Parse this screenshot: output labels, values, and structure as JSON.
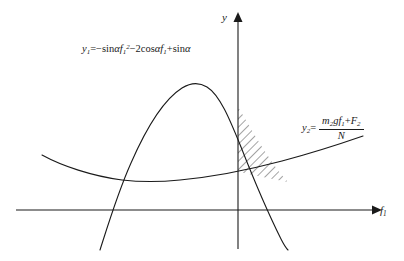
{
  "figure": {
    "background_color": "#ffffff",
    "stroke_color": "#1a1a1a",
    "axes": {
      "y_axis_label": "y",
      "x_axis_label_base": "f",
      "x_axis_label_sub": "1"
    },
    "equations": {
      "curve1": {
        "lhs_base": "y",
        "lhs_sub": "1",
        "equals": "=",
        "term1_sign": "−",
        "term1_fn": "sin",
        "term1_angle": "α",
        "term1_var": "f",
        "term1_var_sub": "1",
        "term1_var_sup": "2",
        "term2_sign": "−",
        "term2_coef": "2",
        "term2_fn": "cos",
        "term2_angle": "α",
        "term2_var": "f",
        "term2_var_sub": "1",
        "term3_sign": "+",
        "term3_fn": "sin",
        "term3_angle": "α",
        "plain_text": "y₁ = −sinαf₁² − 2cosαf₁ + sinα"
      },
      "curve2": {
        "lhs_base": "y",
        "lhs_sub": "2",
        "equals": "=",
        "numerator_m": "m",
        "numerator_m_sub": "2",
        "numerator_g": "g",
        "numerator_f": "f",
        "numerator_f_sub": "1",
        "numerator_plus": "+",
        "numerator_F": "F",
        "numerator_F_sub": "2",
        "denominator": "N",
        "plain_text": "y₂ = (m₂g f₁ + F₂) / N"
      }
    },
    "curves": {
      "parabola_y1": {
        "name": "downward-parabola",
        "peak_x": 197,
        "peak_y": 83
      },
      "curve_y2": {
        "name": "upward-curve",
        "min_x": 150,
        "min_y": 180
      },
      "hatched_region": {
        "name": "shaded-intersection-area",
        "hatch_angle_deg": 45
      }
    }
  }
}
